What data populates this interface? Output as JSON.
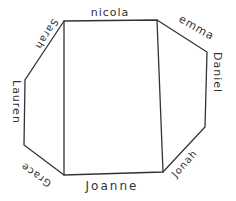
{
  "diagram": {
    "colors": {
      "stroke": "#333333",
      "background": "#ffffff"
    },
    "labels": {
      "top": "nicola",
      "top_right": "emma",
      "right": "Daniel",
      "bottom_right": "Jonah",
      "bottom": "Joanne",
      "bottom_left": "Grace",
      "left": "Lauren",
      "top_left": "Sarah"
    }
  }
}
